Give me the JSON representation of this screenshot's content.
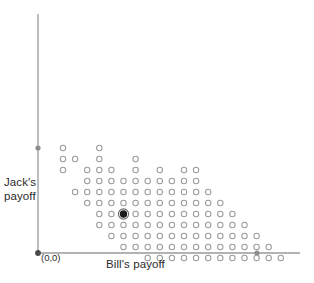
{
  "figure": {
    "kind": "scatter-payoff-diagram",
    "background_color": "#ffffff"
  },
  "labels": {
    "y_axis": "Jack's\npayoff",
    "x_axis": "Bill's payoff",
    "origin": "(0,0)"
  },
  "axes": {
    "color": "#9a9a9a",
    "origin_px": [
      38,
      253
    ],
    "y_axis_x_px": 38,
    "y_axis_top_px": 14,
    "x_axis_right_px": 300,
    "y_axis_marker_y_px": 148,
    "x_axis_marker_x_px": 257,
    "marker_color": "#8d8d8d"
  },
  "chart_data": {
    "type": "scatter",
    "title": "",
    "xlabel": "Bill's payoff",
    "ylabel": "Jack's payoff",
    "grid": false,
    "legend": null,
    "origin_label": "(0,0)",
    "dot_style": {
      "open_marker_radius_px": 2.7,
      "open_marker_stroke": "#9b9b9b",
      "open_marker_fill": "#ffffff",
      "highlight_marker_fill": "#1c1c1c",
      "highlight_marker_radius_px": 3.1
    },
    "grid_spacing_px": {
      "x": 12.1,
      "y": 11.0
    },
    "grid_origin_px": {
      "x": 63,
      "y": 148
    },
    "highlight_point_grid": [
      5,
      6
    ],
    "highlight_point_px": [
      120,
      213
    ],
    "note": "Open circles mark feasible (Bill, Jack) payoff pairs; the single filled circle marks the selected/highlighted allocation.",
    "points_grid": [
      [
        0,
        0
      ],
      [
        3,
        0
      ],
      [
        0,
        1
      ],
      [
        3,
        1
      ],
      [
        6,
        1
      ],
      [
        1,
        1
      ],
      [
        0,
        2
      ],
      [
        2,
        2
      ],
      [
        3,
        2
      ],
      [
        4,
        2
      ],
      [
        6,
        2
      ],
      [
        8,
        2
      ],
      [
        10,
        2
      ],
      [
        11,
        2
      ],
      [
        2,
        3
      ],
      [
        3,
        3
      ],
      [
        4,
        3
      ],
      [
        5,
        3
      ],
      [
        6,
        3
      ],
      [
        7,
        3
      ],
      [
        8,
        3
      ],
      [
        9,
        3
      ],
      [
        10,
        3
      ],
      [
        11,
        3
      ],
      [
        1,
        4
      ],
      [
        2,
        4
      ],
      [
        3,
        4
      ],
      [
        4,
        4
      ],
      [
        5,
        4
      ],
      [
        6,
        4
      ],
      [
        7,
        4
      ],
      [
        8,
        4
      ],
      [
        9,
        4
      ],
      [
        10,
        4
      ],
      [
        11,
        4
      ],
      [
        12,
        4
      ],
      [
        2,
        5
      ],
      [
        3,
        5
      ],
      [
        4,
        5
      ],
      [
        5,
        5
      ],
      [
        6,
        5
      ],
      [
        7,
        5
      ],
      [
        8,
        5
      ],
      [
        9,
        5
      ],
      [
        10,
        5
      ],
      [
        11,
        5
      ],
      [
        12,
        5
      ],
      [
        13,
        5
      ],
      [
        3,
        6
      ],
      [
        4,
        6
      ],
      [
        5,
        6
      ],
      [
        6,
        6
      ],
      [
        7,
        6
      ],
      [
        8,
        6
      ],
      [
        9,
        6
      ],
      [
        10,
        6
      ],
      [
        11,
        6
      ],
      [
        12,
        6
      ],
      [
        13,
        6
      ],
      [
        14,
        6
      ],
      [
        3,
        7
      ],
      [
        4,
        7
      ],
      [
        5,
        7
      ],
      [
        6,
        7
      ],
      [
        7,
        7
      ],
      [
        8,
        7
      ],
      [
        9,
        7
      ],
      [
        10,
        7
      ],
      [
        11,
        7
      ],
      [
        12,
        7
      ],
      [
        13,
        7
      ],
      [
        14,
        7
      ],
      [
        15,
        7
      ],
      [
        4,
        8
      ],
      [
        5,
        8
      ],
      [
        6,
        8
      ],
      [
        7,
        8
      ],
      [
        8,
        8
      ],
      [
        9,
        8
      ],
      [
        10,
        8
      ],
      [
        11,
        8
      ],
      [
        12,
        8
      ],
      [
        13,
        8
      ],
      [
        14,
        8
      ],
      [
        15,
        8
      ],
      [
        16,
        8
      ],
      [
        5,
        9
      ],
      [
        6,
        9
      ],
      [
        7,
        9
      ],
      [
        8,
        9
      ],
      [
        9,
        9
      ],
      [
        10,
        9
      ],
      [
        11,
        9
      ],
      [
        12,
        9
      ],
      [
        13,
        9
      ],
      [
        14,
        9
      ],
      [
        15,
        9
      ],
      [
        16,
        9
      ],
      [
        17,
        9
      ],
      [
        7,
        10
      ],
      [
        8,
        10
      ],
      [
        9,
        10
      ],
      [
        10,
        10
      ],
      [
        11,
        10
      ],
      [
        12,
        10
      ],
      [
        13,
        10
      ],
      [
        14,
        10
      ],
      [
        15,
        10
      ],
      [
        16,
        10
      ],
      [
        17,
        10
      ],
      [
        18,
        10
      ]
    ],
    "xlim_px": [
      38,
      300
    ],
    "ylim_px": [
      14,
      253
    ]
  }
}
